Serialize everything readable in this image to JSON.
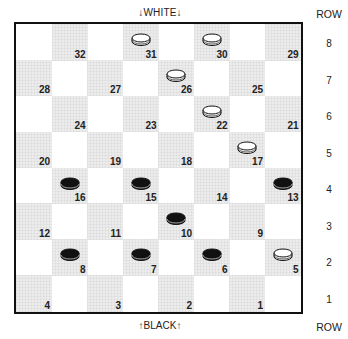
{
  "diagram": {
    "top_label": "↓WHITE↓",
    "bottom_label": "↑BLACK↑",
    "row_header": "ROW",
    "rows": [
      "8",
      "7",
      "6",
      "5",
      "4",
      "3",
      "2",
      "1"
    ],
    "colors": {
      "border": "#111111",
      "dark_square": "#ececec",
      "light_square": "#ffffff",
      "white_piece": "#ffffff",
      "black_piece": "#111111"
    },
    "squares": [
      {
        "n": "32",
        "row": 0,
        "col": 1
      },
      {
        "n": "31",
        "row": 0,
        "col": 3
      },
      {
        "n": "30",
        "row": 0,
        "col": 5
      },
      {
        "n": "29",
        "row": 0,
        "col": 7
      },
      {
        "n": "28",
        "row": 1,
        "col": 0
      },
      {
        "n": "27",
        "row": 1,
        "col": 2
      },
      {
        "n": "26",
        "row": 1,
        "col": 4
      },
      {
        "n": "25",
        "row": 1,
        "col": 6
      },
      {
        "n": "24",
        "row": 2,
        "col": 1
      },
      {
        "n": "23",
        "row": 2,
        "col": 3
      },
      {
        "n": "22",
        "row": 2,
        "col": 5
      },
      {
        "n": "21",
        "row": 2,
        "col": 7
      },
      {
        "n": "20",
        "row": 3,
        "col": 0
      },
      {
        "n": "19",
        "row": 3,
        "col": 2
      },
      {
        "n": "18",
        "row": 3,
        "col": 4
      },
      {
        "n": "17",
        "row": 3,
        "col": 6
      },
      {
        "n": "16",
        "row": 4,
        "col": 1
      },
      {
        "n": "15",
        "row": 4,
        "col": 3
      },
      {
        "n": "14",
        "row": 4,
        "col": 5
      },
      {
        "n": "13",
        "row": 4,
        "col": 7
      },
      {
        "n": "12",
        "row": 5,
        "col": 0
      },
      {
        "n": "11",
        "row": 5,
        "col": 2
      },
      {
        "n": "10",
        "row": 5,
        "col": 4
      },
      {
        "n": "9",
        "row": 5,
        "col": 6
      },
      {
        "n": "8",
        "row": 6,
        "col": 1
      },
      {
        "n": "7",
        "row": 6,
        "col": 3
      },
      {
        "n": "6",
        "row": 6,
        "col": 5
      },
      {
        "n": "5",
        "row": 6,
        "col": 7
      },
      {
        "n": "4",
        "row": 7,
        "col": 0
      },
      {
        "n": "3",
        "row": 7,
        "col": 2
      },
      {
        "n": "2",
        "row": 7,
        "col": 4
      },
      {
        "n": "1",
        "row": 7,
        "col": 6
      }
    ],
    "pieces": {
      "white": [
        "31",
        "30",
        "26",
        "22",
        "17",
        "5"
      ],
      "black": [
        "16",
        "15",
        "13",
        "10",
        "8",
        "7",
        "6"
      ]
    }
  }
}
